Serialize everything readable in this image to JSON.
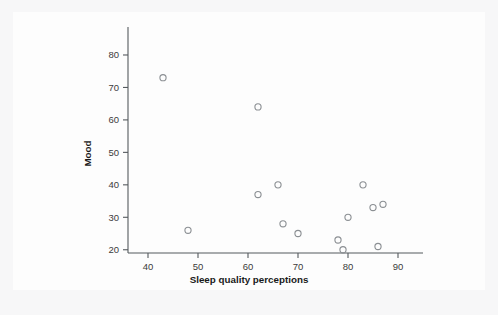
{
  "chart_data": {
    "type": "scatter",
    "title": "",
    "xlabel": "Sleep quality perceptions",
    "ylabel": "Mood",
    "xlim": [
      36,
      93
    ],
    "ylim": [
      19,
      84
    ],
    "xticks": [
      40,
      50,
      60,
      70,
      80,
      90
    ],
    "yticks": [
      20,
      30,
      40,
      50,
      60,
      70,
      80
    ],
    "xtick_labels": [
      "40",
      "50",
      "60",
      "70",
      "80",
      "90"
    ],
    "ytick_labels": [
      "20",
      "30",
      "40",
      "50",
      "60",
      "70",
      "80"
    ],
    "grid": false,
    "legend": null,
    "marker": "open-circle",
    "marker_color": "#8b8f93",
    "points": [
      {
        "x": 43,
        "y": 73
      },
      {
        "x": 48,
        "y": 26
      },
      {
        "x": 62,
        "y": 64
      },
      {
        "x": 62,
        "y": 37
      },
      {
        "x": 66,
        "y": 40
      },
      {
        "x": 67,
        "y": 28
      },
      {
        "x": 70,
        "y": 25
      },
      {
        "x": 78,
        "y": 23
      },
      {
        "x": 79,
        "y": 20
      },
      {
        "x": 80,
        "y": 30
      },
      {
        "x": 83,
        "y": 40
      },
      {
        "x": 85,
        "y": 33
      },
      {
        "x": 86,
        "y": 21
      },
      {
        "x": 87,
        "y": 34
      }
    ]
  },
  "figure": {
    "background_color": "#f7f7f8",
    "card_color": "#fdfdfd",
    "axis_color": "#555a5e",
    "text_color": "#1a1a1a"
  }
}
